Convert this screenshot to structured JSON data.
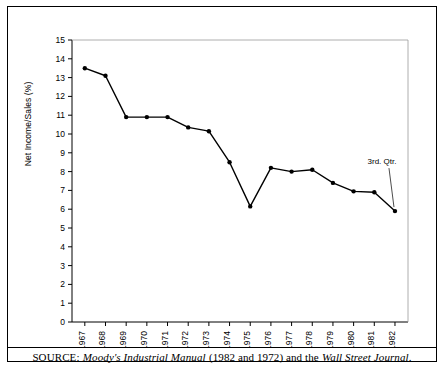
{
  "chart_data": {
    "type": "line",
    "title": "",
    "xlabel": "",
    "ylabel": "Net Income/Sales (%)",
    "xlim": [
      1966.4,
      1982.6
    ],
    "ylim": [
      0,
      15
    ],
    "ytick_step": 1,
    "grid": false,
    "legend": false,
    "marker": "filled-circle",
    "line_color": "#000000",
    "categories": [
      "1967",
      "1968",
      "1969",
      "1970",
      "1971",
      "1972",
      "1973",
      "1974",
      "1975",
      "1976",
      "1977",
      "1978",
      "1979",
      "1980",
      "1981",
      "1982"
    ],
    "values": [
      13.5,
      13.1,
      10.9,
      10.9,
      10.9,
      10.35,
      10.15,
      8.5,
      6.15,
      8.2,
      8.0,
      8.1,
      7.4,
      6.95,
      6.9,
      5.9
    ],
    "ytick_labels": [
      "0",
      "1",
      "2",
      "3",
      "4",
      "5",
      "6",
      "7",
      "8",
      "9",
      "10",
      "11",
      "12",
      "13",
      "14",
      "15"
    ],
    "annotations": [
      {
        "text": "3rd. Qtr.",
        "points_to_category": "1982",
        "points_to_value": 5.9
      }
    ]
  },
  "source": {
    "prefix": "SOURCE:",
    "italic_1": "Moody's Industrial Manual",
    "middle": "(1982 and 1972) and the",
    "italic_2": "Wall Street Journal",
    "suffix": "."
  }
}
